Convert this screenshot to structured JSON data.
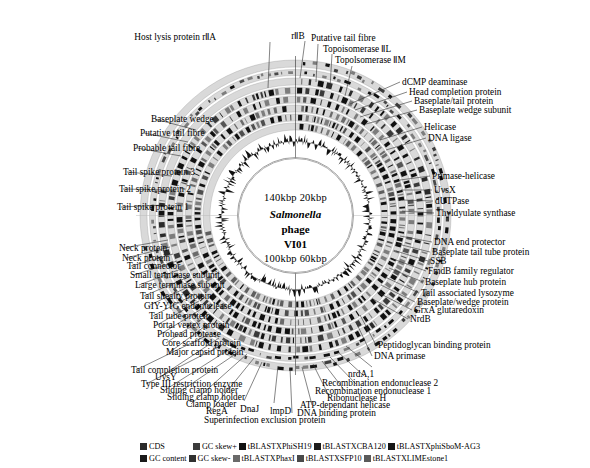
{
  "center": {
    "top_ticks": "140kbp  20kbp",
    "organism": "Salmonella",
    "phage_word": "phage",
    "strain": "VI01",
    "bottom_ticks": "100kbp 60kbp"
  },
  "labels_top": [
    {
      "text": "Host lysis protein rⅡA",
      "x": 216,
      "y": 32,
      "align": "right",
      "lx": 270,
      "ly": 42,
      "tx": 268,
      "ty": 88
    },
    {
      "text": "rⅡB",
      "x": 298,
      "y": 31,
      "align": "center",
      "lx": 305,
      "ly": 41,
      "tx": 300,
      "ty": 78
    },
    {
      "text": "Putative tail fibre",
      "x": 311,
      "y": 33,
      "align": "left",
      "lx": 318,
      "ly": 44,
      "tx": 316,
      "ty": 82
    },
    {
      "text": "Topoisomerase ⅡL",
      "x": 323,
      "y": 44,
      "align": "left",
      "lx": 332,
      "ly": 54,
      "tx": 330,
      "ty": 88
    },
    {
      "text": "Topolsomerase ⅡM",
      "x": 335,
      "y": 55,
      "align": "left",
      "lx": 352,
      "ly": 66,
      "tx": 345,
      "ty": 96
    }
  ],
  "labels_right": [
    {
      "text": "dCMP deaminase",
      "x": 402,
      "y": 77,
      "lx": 400,
      "ly": 82,
      "tx": 350,
      "ty": 104
    },
    {
      "text": "Head completion protein",
      "x": 409,
      "y": 87,
      "lx": 407,
      "ly": 92,
      "tx": 355,
      "ty": 110
    },
    {
      "text": "Baseplate/tail protein",
      "x": 414,
      "y": 96,
      "lx": 412,
      "ly": 101,
      "tx": 360,
      "ty": 117
    },
    {
      "text": "Baseplate wedge subunit",
      "x": 419,
      "y": 105,
      "lx": 417,
      "ly": 110,
      "tx": 366,
      "ty": 124
    },
    {
      "text": "Helicase",
      "x": 424,
      "y": 122,
      "lx": 422,
      "ly": 127,
      "tx": 380,
      "ty": 140
    },
    {
      "text": "DNA ligase",
      "x": 428,
      "y": 133,
      "lx": 426,
      "ly": 138,
      "tx": 386,
      "ty": 150
    },
    {
      "text": "Primase-helicase",
      "x": 432,
      "y": 171,
      "lx": 430,
      "ly": 176,
      "tx": 400,
      "ty": 180
    },
    {
      "text": "UvsX",
      "x": 434,
      "y": 185,
      "lx": 432,
      "ly": 190,
      "tx": 401,
      "ty": 190
    },
    {
      "text": "dUTPase",
      "x": 435,
      "y": 196,
      "lx": 433,
      "ly": 201,
      "tx": 402,
      "ty": 200
    },
    {
      "text": "Thyldyulate synthase",
      "x": 436,
      "y": 208,
      "lx": 434,
      "ly": 213,
      "tx": 402,
      "ty": 211
    },
    {
      "text": "DNA end protector",
      "x": 434,
      "y": 237,
      "lx": 432,
      "ly": 242,
      "tx": 400,
      "ty": 236
    },
    {
      "text": "Baseplate tail tube protein",
      "x": 432,
      "y": 247,
      "lx": 430,
      "ly": 252,
      "tx": 398,
      "ty": 244
    },
    {
      "text": "SSB",
      "x": 430,
      "y": 256,
      "lx": 428,
      "ly": 261,
      "tx": 396,
      "ty": 251
    },
    {
      "text": "FmdB family regulator",
      "x": 428,
      "y": 266,
      "lx": 426,
      "ly": 271,
      "tx": 393,
      "ty": 259
    },
    {
      "text": "Baseplate hub protein",
      "x": 425,
      "y": 277,
      "lx": 423,
      "ly": 282,
      "tx": 389,
      "ty": 268
    },
    {
      "text": "Tail associated lysozyme",
      "x": 421,
      "y": 288,
      "lx": 419,
      "ly": 293,
      "tx": 385,
      "ty": 277
    },
    {
      "text": "Baseplate/wedge protein",
      "x": 417,
      "y": 297,
      "lx": 415,
      "ly": 302,
      "tx": 381,
      "ty": 285
    },
    {
      "text": "GrxA glutaredoxin",
      "x": 414,
      "y": 305,
      "lx": 412,
      "ly": 310,
      "tx": 377,
      "ty": 292
    },
    {
      "text": "NrdB",
      "x": 410,
      "y": 314,
      "lx": 408,
      "ly": 319,
      "tx": 373,
      "ty": 299
    },
    {
      "text": "Peptidoglycan binding protein",
      "x": 378,
      "y": 340,
      "lx": 376,
      "ly": 345,
      "tx": 360,
      "ty": 315
    },
    {
      "text": "DNA primase",
      "x": 374,
      "y": 351,
      "lx": 372,
      "ly": 356,
      "tx": 356,
      "ty": 322
    }
  ],
  "labels_left": [
    {
      "text": "Baseplate wedge",
      "x": 151,
      "y": 114,
      "lx": 155,
      "ly": 119,
      "tx": 196,
      "ty": 130
    },
    {
      "text": "Putative tail fibre",
      "x": 140,
      "y": 128,
      "lx": 144,
      "ly": 133,
      "tx": 188,
      "ty": 142
    },
    {
      "text": "Probable tail fibre",
      "x": 133,
      "y": 143,
      "lx": 137,
      "ly": 148,
      "tx": 181,
      "ty": 156
    },
    {
      "text": "Tail spike protein 3",
      "x": 123,
      "y": 167,
      "lx": 127,
      "ly": 172,
      "tx": 172,
      "ty": 176
    },
    {
      "text": "Tail spike protein 2",
      "x": 119,
      "y": 184,
      "lx": 123,
      "ly": 189,
      "tx": 168,
      "ty": 190
    },
    {
      "text": "Tail spike protein 1",
      "x": 117,
      "y": 202,
      "lx": 121,
      "ly": 207,
      "tx": 165,
      "ty": 205
    },
    {
      "text": "Neck protein",
      "x": 119,
      "y": 243,
      "lx": 123,
      "ly": 248,
      "tx": 168,
      "ty": 240
    },
    {
      "text": "Neck protein",
      "x": 122,
      "y": 253,
      "lx": 126,
      "ly": 258,
      "tx": 170,
      "ty": 247
    },
    {
      "text": "Tail connector",
      "x": 127,
      "y": 261,
      "lx": 131,
      "ly": 266,
      "tx": 173,
      "ty": 254
    },
    {
      "text": "Small terminase subunit",
      "x": 130,
      "y": 270,
      "lx": 134,
      "ly": 275,
      "tx": 177,
      "ty": 261
    },
    {
      "text": "Large terminase subunit",
      "x": 135,
      "y": 280,
      "lx": 139,
      "ly": 285,
      "tx": 181,
      "ty": 269
    },
    {
      "text": "Tail shealty protein",
      "x": 140,
      "y": 291,
      "lx": 144,
      "ly": 296,
      "tx": 186,
      "ty": 278
    },
    {
      "text": "GIY-YIG endonuclease",
      "x": 144,
      "y": 301,
      "lx": 148,
      "ly": 306,
      "tx": 190,
      "ty": 286
    },
    {
      "text": "Tail tube protein",
      "x": 149,
      "y": 311,
      "lx": 153,
      "ly": 316,
      "tx": 195,
      "ty": 294
    },
    {
      "text": "Portal vertex protein",
      "x": 153,
      "y": 320,
      "lx": 157,
      "ly": 325,
      "tx": 199,
      "ty": 301
    },
    {
      "text": "Prohead protease",
      "x": 157,
      "y": 329,
      "lx": 161,
      "ly": 334,
      "tx": 203,
      "ty": 308
    },
    {
      "text": "Core scaffold protein",
      "x": 162,
      "y": 338,
      "lx": 166,
      "ly": 343,
      "tx": 208,
      "ty": 315
    },
    {
      "text": "Major capsid protein",
      "x": 166,
      "y": 347,
      "lx": 170,
      "ly": 352,
      "tx": 212,
      "ty": 321
    }
  ],
  "labels_bottom_left": [
    {
      "text": "Tail completion protein",
      "x": 131,
      "y": 365,
      "lx": 136,
      "ly": 370,
      "tx": 212,
      "ty": 333
    },
    {
      "text": "UvsY",
      "x": 155,
      "y": 372,
      "lx": 160,
      "ly": 377,
      "tx": 219,
      "ty": 338
    },
    {
      "text": "Type III restriction enzyme",
      "x": 141,
      "y": 379,
      "lx": 146,
      "ly": 384,
      "tx": 226,
      "ty": 343
    },
    {
      "text": "Sliding clamp holder",
      "x": 160,
      "y": 385,
      "lx": 165,
      "ly": 390,
      "tx": 233,
      "ty": 347
    },
    {
      "text": "Sliding clamp holder",
      "x": 167,
      "y": 392,
      "lx": 172,
      "ly": 397,
      "tx": 240,
      "ty": 351
    },
    {
      "text": "Clamp loader",
      "x": 186,
      "y": 399,
      "lx": 191,
      "ly": 404,
      "tx": 247,
      "ty": 354
    },
    {
      "text": "RegA",
      "x": 206,
      "y": 406,
      "lx": 211,
      "ly": 411,
      "tx": 254,
      "ty": 358
    }
  ],
  "labels_bottom": [
    {
      "text": "DnaJ",
      "x": 240,
      "y": 404,
      "lx": 244,
      "ly": 401,
      "tx": 262,
      "ty": 362
    },
    {
      "text": "lmpD",
      "x": 270,
      "y": 406,
      "lx": 274,
      "ly": 403,
      "tx": 278,
      "ty": 366
    },
    {
      "text": "Superinfection exclusion protein",
      "x": 204,
      "y": 415,
      "lx": 292,
      "ly": 413,
      "tx": 290,
      "ty": 368
    },
    {
      "text": "DNA binding protein",
      "x": 297,
      "y": 408,
      "lx": 312,
      "ly": 405,
      "tx": 302,
      "ty": 367
    },
    {
      "text": "ATP-dependant helicase",
      "x": 300,
      "y": 400,
      "lx": 330,
      "ly": 398,
      "tx": 313,
      "ty": 364
    },
    {
      "text": "Ribonuclease H",
      "x": 327,
      "y": 393,
      "lx": 345,
      "ly": 391,
      "tx": 322,
      "ty": 361
    },
    {
      "text": "Recombination endonuclease 1",
      "x": 315,
      "y": 386,
      "lx": 356,
      "ly": 384,
      "tx": 330,
      "ty": 357
    },
    {
      "text": "Recombination endonuclease 2",
      "x": 322,
      "y": 378,
      "lx": 364,
      "ly": 376,
      "tx": 338,
      "ty": 352
    },
    {
      "text": "nrdA,1",
      "x": 348,
      "y": 369,
      "lx": 372,
      "ly": 367,
      "tx": 346,
      "ty": 346
    }
  ],
  "legend": {
    "row1": [
      {
        "label": "CDS",
        "color": "#2b2b2b"
      },
      {
        "label": "GC skew+",
        "color": "#3b3b3b"
      },
      {
        "label": "tBLASTXPhiSH19",
        "color": "#111111"
      },
      {
        "label": "tBLASTXCBA120",
        "color": "#1c1c1c"
      },
      {
        "label": "tBLASTXphiSboM-AG3",
        "color": "#161616"
      }
    ],
    "row2": [
      {
        "label": "GC content",
        "color": "#1a1a1a"
      },
      {
        "label": "GC skew-",
        "color": "#303030"
      },
      {
        "label": "tBLASTXPhaxI",
        "color": "#6a6a6a"
      },
      {
        "label": "tBLASTXSFP10",
        "color": "#4a4a4a"
      },
      {
        "label": "tBLASTXLIMEstone1",
        "color": "#5a5a5a"
      }
    ]
  },
  "rings": [
    {
      "name": "cds-outer",
      "r": 152,
      "w": 7,
      "shade": "#3d3d3d"
    },
    {
      "name": "cds-inner",
      "r": 143,
      "w": 6,
      "shade": "#4a4a4a"
    },
    {
      "name": "tblastx-phish19",
      "r": 134,
      "w": 7,
      "shade": "#2a2a2a"
    },
    {
      "name": "tblastx-cba120",
      "r": 125,
      "w": 7,
      "shade": "#3a3a3a"
    },
    {
      "name": "tblastx-phisbom",
      "r": 116,
      "w": 7,
      "shade": "#555555"
    },
    {
      "name": "tblastx-phaxi",
      "r": 107,
      "w": 7,
      "shade": "#6b6b6b"
    },
    {
      "name": "tblastx-sfp10",
      "r": 98,
      "w": 7,
      "shade": "#4e4e4e"
    },
    {
      "name": "tblastx-limestone",
      "r": 89,
      "w": 7,
      "shade": "#5e5e5e"
    },
    {
      "name": "gc-content",
      "r": 74,
      "w": 22,
      "shade": "#111111"
    },
    {
      "name": "gc-skew",
      "r": 46,
      "w": 20,
      "shade": "#111111"
    }
  ]
}
